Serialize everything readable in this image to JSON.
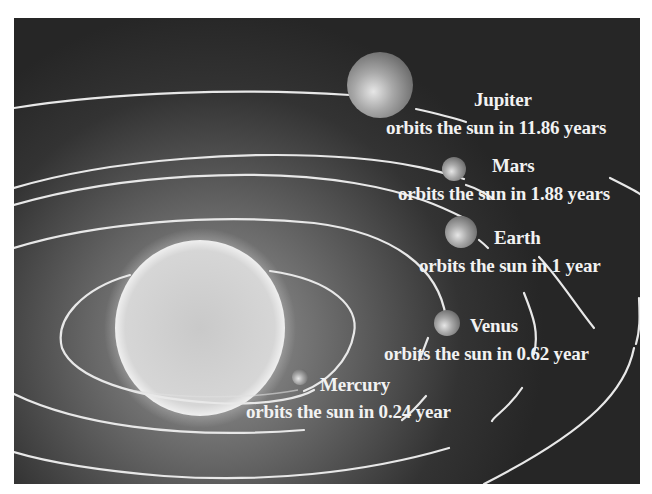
{
  "diagram": {
    "sun": {
      "label": ""
    },
    "planets": [
      {
        "name": "Jupiter",
        "caption": "orbits the sun in 11.86 years",
        "period_years": 11.86
      },
      {
        "name": "Mars",
        "caption": "orbits the sun in 1.88 years",
        "period_years": 1.88
      },
      {
        "name": "Earth",
        "caption": "orbits the sun in 1 year",
        "period_years": 1
      },
      {
        "name": "Venus",
        "caption": "orbits the sun in 0.62 year",
        "period_years": 0.62
      },
      {
        "name": "Mercury",
        "caption": "orbits the sun in 0.24 year",
        "period_years": 0.24
      }
    ],
    "colors": {
      "background": "#2a2a2a",
      "orbit": "#e8e8e8",
      "text": "#f2f2f2",
      "sun": "#d8d8d8"
    }
  }
}
